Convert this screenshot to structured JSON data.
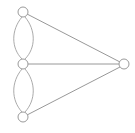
{
  "diagram": {
    "type": "graph",
    "canvas": {
      "width": 135,
      "height": 133,
      "background": "#ffffff"
    },
    "style": {
      "node_fill": "#ffffff",
      "node_stroke": "#9a9a9a",
      "node_radius": 5,
      "node_stroke_width": 1,
      "edge_stroke": "#8c8c8c",
      "edge_curve_stroke": "#a0a0a0",
      "edge_stroke_width": 0.9
    },
    "nodes": [
      {
        "id": "n-top",
        "label": "",
        "cx": 23,
        "cy": 12,
        "r": 5
      },
      {
        "id": "n-middle",
        "label": "",
        "cx": 23,
        "cy": 64,
        "r": 5
      },
      {
        "id": "n-bottom",
        "label": "",
        "cx": 23,
        "cy": 117,
        "r": 5
      },
      {
        "id": "n-right",
        "label": "",
        "cx": 124,
        "cy": 64,
        "r": 5
      }
    ],
    "edges": [
      {
        "id": "e-top-middle-left",
        "from": "n-top",
        "to": "n-middle",
        "kind": "curve",
        "path": "M 22 17 C 11 30 11 48 22 59"
      },
      {
        "id": "e-top-middle-right",
        "from": "n-top",
        "to": "n-middle",
        "kind": "curve",
        "path": "M 25 17 C 36 30 36 48 25 59"
      },
      {
        "id": "e-middle-bottom-left",
        "from": "n-middle",
        "to": "n-bottom",
        "kind": "curve",
        "path": "M 22 69 C 11 82 11 100 22 112"
      },
      {
        "id": "e-middle-bottom-right",
        "from": "n-middle",
        "to": "n-bottom",
        "kind": "curve",
        "path": "M 25 69 C 36 82 36 100 25 112"
      },
      {
        "id": "e-top-right",
        "from": "n-top",
        "to": "n-right",
        "kind": "line",
        "x1": 27,
        "y1": 14,
        "x2": 120,
        "y2": 62
      },
      {
        "id": "e-middle-right",
        "from": "n-middle",
        "to": "n-right",
        "kind": "line",
        "x1": 28,
        "y1": 64,
        "x2": 119,
        "y2": 64
      },
      {
        "id": "e-bottom-right",
        "from": "n-bottom",
        "to": "n-right",
        "kind": "line",
        "x1": 27,
        "y1": 115,
        "x2": 120,
        "y2": 67
      }
    ]
  }
}
